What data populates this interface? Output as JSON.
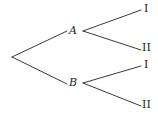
{
  "diagram": {
    "type": "probability-tree",
    "title": "",
    "background_color": "#ffffff",
    "stroke_color": "#3a3a3a",
    "text_color": "#1b1b1b",
    "root": {
      "name": "root-node",
      "label": "",
      "x": 12,
      "y": 57
    },
    "level1": [
      {
        "name": "node-a",
        "label": "A",
        "x": 79,
        "y": 31
      },
      {
        "name": "node-b",
        "label": "B",
        "x": 79,
        "y": 83
      }
    ],
    "level2": [
      {
        "name": "outcome-a-one",
        "label": "I",
        "parent": "A",
        "x": 146,
        "y": 9
      },
      {
        "name": "outcome-a-two",
        "label": "II",
        "parent": "A",
        "x": 146,
        "y": 48
      },
      {
        "name": "outcome-b-one",
        "label": "I",
        "parent": "B",
        "x": 146,
        "y": 65
      },
      {
        "name": "outcome-b-two",
        "label": "II",
        "parent": "B",
        "x": 146,
        "y": 105
      }
    ],
    "edges": [
      {
        "name": "edge-root-to-a",
        "x1": 12,
        "y1": 57,
        "x2": 67,
        "y2": 31
      },
      {
        "name": "edge-root-to-b",
        "x1": 12,
        "y1": 57,
        "x2": 67,
        "y2": 84
      },
      {
        "name": "edge-a-to-outcome-one",
        "x1": 83,
        "y1": 31,
        "x2": 141,
        "y2": 10
      },
      {
        "name": "edge-a-to-outcome-two",
        "x1": 83,
        "y1": 31,
        "x2": 141,
        "y2": 50
      },
      {
        "name": "edge-b-to-outcome-one",
        "x1": 83,
        "y1": 83,
        "x2": 141,
        "y2": 66
      },
      {
        "name": "edge-b-to-outcome-two",
        "x1": 83,
        "y1": 83,
        "x2": 141,
        "y2": 106
      }
    ]
  }
}
